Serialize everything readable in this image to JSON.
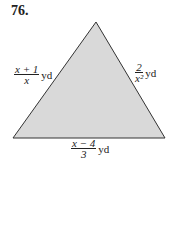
{
  "problem_number": "76.",
  "shape": {
    "type": "triangle",
    "fill": "#d9d9d9",
    "stroke": "#333333",
    "vertices": [
      [
        96,
        22
      ],
      [
        13,
        138
      ],
      [
        165,
        138
      ]
    ]
  },
  "labels": {
    "left": {
      "numerator": "x + 1",
      "denominator": "x",
      "unit": "yd"
    },
    "right": {
      "numerator": "2",
      "denominator": "x²",
      "unit": "yd"
    },
    "bottom": {
      "numerator": "x − 4",
      "denominator": "3",
      "unit": "yd"
    }
  }
}
